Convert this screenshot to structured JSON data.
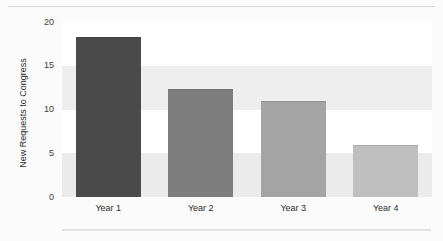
{
  "chart_data": {
    "type": "bar",
    "title": "",
    "xlabel": "",
    "ylabel": "New Requests to Congress",
    "categories": [
      "Year 1",
      "Year 2",
      "Year 3",
      "Year 4"
    ],
    "values": [
      18.3,
      12.4,
      11.0,
      6.0
    ],
    "series": [
      {
        "name": "New Requests to Congress",
        "values": [
          18.3,
          12.4,
          11.0,
          6.0
        ]
      }
    ],
    "ylim": [
      0,
      20
    ],
    "yticks": [
      0,
      5,
      10,
      15,
      20
    ],
    "ytick_labels": [
      "0",
      "5",
      "10",
      "15",
      "20"
    ],
    "grid": false,
    "banded_background": true,
    "legend": "none",
    "bar_colors": [
      "#4a4a4a",
      "#7d7d7d",
      "#a4a4a4",
      "#bfbfbf"
    ],
    "band_colors": [
      "#ffffff",
      "#eeeeee",
      "#ffffff",
      "#ebebeb"
    ],
    "figure_background": "#fbfbfb"
  }
}
